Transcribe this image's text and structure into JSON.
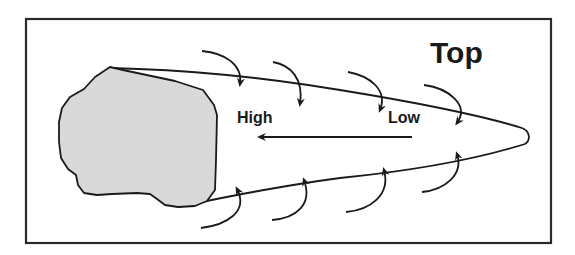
{
  "diagram": {
    "title": "Top",
    "labels": {
      "high": "High",
      "low": "Low"
    },
    "colors": {
      "stroke": "#1a1a1a",
      "obstacle_fill": "#d9d9d9",
      "frame": "#2a2a2a",
      "background": "#ffffff"
    },
    "elements": {
      "obstacle": "irregular gray rock shape",
      "wake": "tapering teardrop outline trailing to the right",
      "pressure_arrow": "straight arrow pointing left from Low to High",
      "top_flow_arrows": 4,
      "bottom_flow_arrows": 4
    }
  }
}
